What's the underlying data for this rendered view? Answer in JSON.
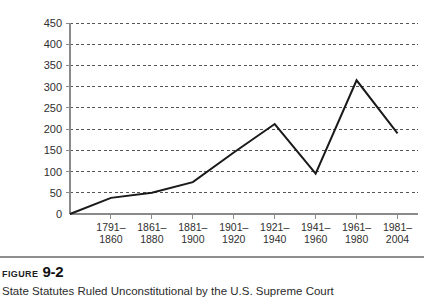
{
  "figure": {
    "label_word": "Figure",
    "number": "9-2",
    "subtitle": "State Statutes Ruled Unconstitutional by the U.S. Supreme Court"
  },
  "colors": {
    "line": "#1a1a1a",
    "grid": "#555555",
    "axis": "#8a8a8a",
    "text": "#2b2b2b",
    "background": "#ffffff"
  },
  "chart_data": {
    "type": "line",
    "title": "State Statutes Ruled Unconstitutional by the U.S. Supreme Court",
    "xlabel": "",
    "ylabel": "",
    "ylim": [
      0,
      450
    ],
    "yticks": [
      0,
      50,
      100,
      150,
      200,
      250,
      300,
      350,
      400,
      450
    ],
    "ytick_labels": [
      "0",
      "50",
      "100",
      "150",
      "200",
      "250",
      "300",
      "350",
      "400",
      "450"
    ],
    "grid": true,
    "grid_style": "dashed",
    "legend": false,
    "origin_value": 0,
    "categories": [
      "1791–\n1860",
      "1861–\n1880",
      "1881–\n1900",
      "1901–\n1920",
      "1921–\n1940",
      "1941–\n1960",
      "1961–\n1980",
      "1981–\n2004"
    ],
    "categories_lines": [
      [
        "1791–",
        "1860"
      ],
      [
        "1861–",
        "1880"
      ],
      [
        "1881–",
        "1900"
      ],
      [
        "1901–",
        "1920"
      ],
      [
        "1921–",
        "1940"
      ],
      [
        "1941–",
        "1960"
      ],
      [
        "1961–",
        "1980"
      ],
      [
        "1981–",
        "2004"
      ]
    ],
    "values": [
      38,
      50,
      75,
      145,
      212,
      95,
      315,
      190
    ]
  }
}
